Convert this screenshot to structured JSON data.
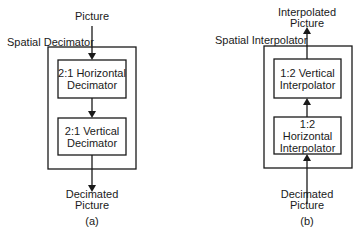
{
  "diagram_a": {
    "input_label": "Picture",
    "container_label": "Spatial Decimator",
    "blocks": [
      {
        "line1": "2:1 Horizontal",
        "line2": "Decimator"
      },
      {
        "line1": "2:1 Vertical",
        "line2": "Decimator"
      }
    ],
    "output_line1": "Decimated",
    "output_line2": "Picture",
    "caption": "(a)"
  },
  "diagram_b": {
    "input_line1": "Decimated",
    "input_line2": "Picture",
    "container_label": "Spatial Interpolator",
    "blocks": [
      {
        "line1": "1:2 Vertical",
        "line2": "Interpolator"
      },
      {
        "line1": "1:2 Horizontal",
        "line2": "Interpolator"
      }
    ],
    "output_line1": "Interpolated",
    "output_line2": "Picture",
    "caption": "(b)"
  }
}
